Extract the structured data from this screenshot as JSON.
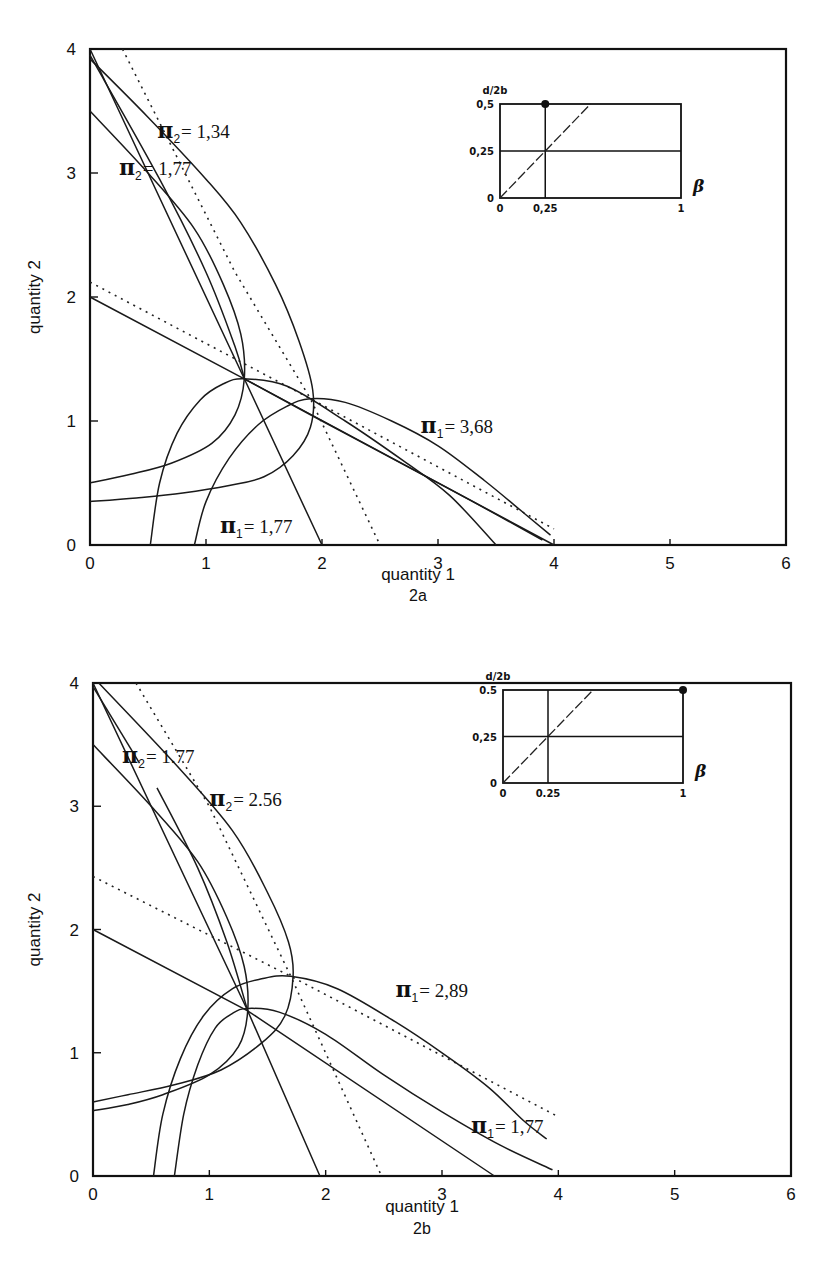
{
  "chart_data": [
    {
      "id": "2a",
      "type": "line",
      "caption": "2a",
      "xlabel": "quantity 1",
      "ylabel": "quantity 2",
      "xlim": [
        0,
        6
      ],
      "ylim": [
        0,
        4
      ],
      "xticks": [
        "0",
        "1",
        "2",
        "3",
        "4",
        "5",
        "6"
      ],
      "yticks": [
        "0",
        "1",
        "2",
        "3",
        "4"
      ],
      "grid": false,
      "annotations": [
        {
          "text_prefix": "π",
          "sub": "2",
          "text": "= 1,34",
          "x": 0.58,
          "y": 3.28
        },
        {
          "text_prefix": "π",
          "sub": "2",
          "text": "= 1,77",
          "x": 0.25,
          "y": 2.98
        },
        {
          "text_prefix": "π",
          "sub": "1",
          "text": "= 3,68",
          "x": 2.85,
          "y": 0.9
        },
        {
          "text_prefix": "π",
          "sub": "1",
          "text": "= 1,77",
          "x": 1.12,
          "y": 0.1
        }
      ],
      "series": [
        {
          "name": "reaction line firm 2 (solid, from q2=4)",
          "style": "solid",
          "points": [
            [
              0,
              4.0
            ],
            [
              1.33,
              1.34
            ],
            [
              2.0,
              0.0
            ]
          ]
        },
        {
          "name": "reaction line firm 1 (solid, from q2=2)",
          "style": "solid",
          "points": [
            [
              0,
              2.0
            ],
            [
              1.33,
              1.34
            ],
            [
              4.0,
              0.0
            ]
          ]
        },
        {
          "name": "reaction line firm 2 dotted (Stackelberg)",
          "style": "dotted",
          "points": [
            [
              0.28,
              4.0
            ],
            [
              1.25,
              2.2
            ],
            [
              1.9,
              1.18
            ],
            [
              2.5,
              0.0
            ]
          ]
        },
        {
          "name": "reaction line firm 1 dotted",
          "style": "dotted",
          "points": [
            [
              0,
              2.12
            ],
            [
              1.9,
              1.18
            ],
            [
              4.0,
              0.13
            ]
          ]
        },
        {
          "name": "π2 = 1,34 iso-profit",
          "style": "solid",
          "points": [
            [
              0,
              3.92
            ],
            [
              0.5,
              3.45
            ],
            [
              1.0,
              2.95
            ],
            [
              1.3,
              2.6
            ],
            [
              1.6,
              2.1
            ],
            [
              1.8,
              1.65
            ],
            [
              1.92,
              1.25
            ],
            [
              1.9,
              0.95
            ],
            [
              1.75,
              0.72
            ],
            [
              1.5,
              0.55
            ],
            [
              1.2,
              0.48
            ],
            [
              0.8,
              0.42
            ],
            [
              0.4,
              0.38
            ],
            [
              0,
              0.35
            ]
          ]
        },
        {
          "name": "π2 = 1,77 iso-profit",
          "style": "solid",
          "points": [
            [
              0,
              3.5
            ],
            [
              0.5,
              3.0
            ],
            [
              0.9,
              2.55
            ],
            [
              1.15,
              2.1
            ],
            [
              1.3,
              1.7
            ],
            [
              1.33,
              1.34
            ],
            [
              1.25,
              1.05
            ],
            [
              1.05,
              0.82
            ],
            [
              0.7,
              0.66
            ],
            [
              0.35,
              0.57
            ],
            [
              0,
              0.5
            ]
          ]
        },
        {
          "name": "π2 upper line from 4 (tangent)",
          "style": "solid",
          "points": [
            [
              0,
              3.95
            ],
            [
              0.6,
              2.95
            ],
            [
              1.0,
              2.2
            ],
            [
              1.25,
              1.6
            ],
            [
              1.33,
              1.34
            ]
          ]
        },
        {
          "name": "π1 = 1,77 iso-profit",
          "style": "solid",
          "points": [
            [
              0.52,
              0.0
            ],
            [
              0.6,
              0.5
            ],
            [
              0.75,
              0.9
            ],
            [
              0.95,
              1.17
            ],
            [
              1.15,
              1.3
            ],
            [
              1.33,
              1.34
            ],
            [
              1.7,
              1.28
            ],
            [
              2.2,
              1.0
            ],
            [
              2.7,
              0.68
            ],
            [
              3.1,
              0.4
            ],
            [
              3.5,
              0.0
            ]
          ]
        },
        {
          "name": "π1 = 3,68 iso-profit",
          "style": "solid",
          "points": [
            [
              0.9,
              0.0
            ],
            [
              1.0,
              0.35
            ],
            [
              1.2,
              0.7
            ],
            [
              1.45,
              0.97
            ],
            [
              1.7,
              1.12
            ],
            [
              1.9,
              1.18
            ],
            [
              2.2,
              1.15
            ],
            [
              2.6,
              1.0
            ],
            [
              3.0,
              0.8
            ],
            [
              3.4,
              0.52
            ],
            [
              3.75,
              0.25
            ],
            [
              3.97,
              0.08
            ]
          ]
        },
        {
          "name": "firm 1 line to (3.9,0)",
          "style": "solid",
          "points": [
            [
              1.33,
              1.34
            ],
            [
              2.0,
              1.0
            ],
            [
              2.7,
              0.65
            ],
            [
              3.3,
              0.35
            ],
            [
              3.9,
              0.04
            ]
          ]
        }
      ],
      "inset": {
        "ylabel": "d/2b",
        "xlabel": "β",
        "yticks": [
          "0",
          "0,25",
          "0,5"
        ],
        "xticks": [
          "0",
          "0,25",
          "1"
        ],
        "marker": {
          "beta": 0.25,
          "d2b": 0.5
        }
      }
    },
    {
      "id": "2b",
      "type": "line",
      "caption": "2b",
      "xlabel": "quantity 1",
      "ylabel": "quantity 2",
      "xlim": [
        0,
        6
      ],
      "ylim": [
        0,
        4
      ],
      "xticks": [
        "0",
        "1",
        "2",
        "3",
        "4",
        "5",
        "6"
      ],
      "yticks": [
        "0",
        "1",
        "2",
        "3",
        "4"
      ],
      "grid": false,
      "annotations": [
        {
          "text_prefix": "π",
          "sub": "2",
          "text": "= 1.77",
          "x": 0.25,
          "y": 3.35
        },
        {
          "text_prefix": "π",
          "sub": "2",
          "text": "= 2.56",
          "x": 1.0,
          "y": 3.0
        },
        {
          "text_prefix": "π",
          "sub": "1",
          "text": "= 2,89",
          "x": 2.6,
          "y": 1.45
        },
        {
          "text_prefix": "π",
          "sub": "1",
          "text": "= 1,77",
          "x": 3.25,
          "y": 0.35
        }
      ],
      "series": [
        {
          "name": "reaction line firm 2 (solid, from q2=4)",
          "style": "solid",
          "points": [
            [
              0,
              4.0
            ],
            [
              1.33,
              1.34
            ],
            [
              1.95,
              0.0
            ]
          ]
        },
        {
          "name": "reaction line firm 1 (solid, from q2=2)",
          "style": "solid",
          "points": [
            [
              0,
              2.0
            ],
            [
              1.33,
              1.34
            ],
            [
              3.45,
              0.0
            ]
          ]
        },
        {
          "name": "reaction line firm 2 dotted",
          "style": "dotted",
          "points": [
            [
              0.37,
              4.0
            ],
            [
              1.0,
              3.0
            ],
            [
              1.7,
              1.62
            ],
            [
              2.48,
              0.0
            ]
          ]
        },
        {
          "name": "reaction line firm 1 dotted",
          "style": "dotted",
          "points": [
            [
              0,
              2.43
            ],
            [
              1.7,
              1.62
            ],
            [
              4.0,
              0.48
            ]
          ]
        },
        {
          "name": "π2 = 2.56 iso-profit",
          "style": "solid",
          "points": [
            [
              0.05,
              4.0
            ],
            [
              0.7,
              3.35
            ],
            [
              1.2,
              2.8
            ],
            [
              1.5,
              2.3
            ],
            [
              1.68,
              1.9
            ],
            [
              1.72,
              1.62
            ],
            [
              1.65,
              1.3
            ],
            [
              1.45,
              1.08
            ],
            [
              1.1,
              0.86
            ],
            [
              0.7,
              0.74
            ],
            [
              0.3,
              0.66
            ],
            [
              0,
              0.6
            ]
          ]
        },
        {
          "name": "π2 = 1.77 iso-profit",
          "style": "solid",
          "points": [
            [
              0,
              3.5
            ],
            [
              0.5,
              3.0
            ],
            [
              0.9,
              2.55
            ],
            [
              1.15,
              2.1
            ],
            [
              1.3,
              1.7
            ],
            [
              1.33,
              1.34
            ],
            [
              1.25,
              1.05
            ],
            [
              1.0,
              0.82
            ],
            [
              0.6,
              0.66
            ],
            [
              0.3,
              0.58
            ],
            [
              0,
              0.53
            ]
          ]
        },
        {
          "name": "π2 upper line (from 4)",
          "style": "solid",
          "points": [
            [
              0,
              3.97
            ],
            [
              0.4,
              3.35
            ]
          ]
        },
        {
          "name": "π2 inner line",
          "style": "solid",
          "points": [
            [
              0.55,
              3.15
            ],
            [
              0.9,
              2.5
            ],
            [
              1.15,
              1.9
            ],
            [
              1.33,
              1.34
            ]
          ]
        },
        {
          "name": "π1 = 1,77 iso-profit",
          "style": "solid",
          "points": [
            [
              0.7,
              0.0
            ],
            [
              0.78,
              0.5
            ],
            [
              0.9,
              0.9
            ],
            [
              1.05,
              1.2
            ],
            [
              1.2,
              1.32
            ],
            [
              1.33,
              1.36
            ],
            [
              1.6,
              1.33
            ],
            [
              2.0,
              1.15
            ],
            [
              2.5,
              0.82
            ],
            [
              3.0,
              0.52
            ],
            [
              3.5,
              0.25
            ],
            [
              3.95,
              0.05
            ]
          ]
        },
        {
          "name": "π1 = 2,89 iso-profit",
          "style": "solid",
          "points": [
            [
              0.52,
              0.0
            ],
            [
              0.6,
              0.5
            ],
            [
              0.75,
              0.95
            ],
            [
              0.95,
              1.3
            ],
            [
              1.2,
              1.52
            ],
            [
              1.45,
              1.6
            ],
            [
              1.7,
              1.62
            ],
            [
              2.1,
              1.52
            ],
            [
              2.6,
              1.25
            ],
            [
              3.0,
              1.0
            ],
            [
              3.4,
              0.72
            ],
            [
              3.7,
              0.45
            ],
            [
              3.9,
              0.3
            ]
          ]
        }
      ],
      "inset": {
        "ylabel": "d/2b",
        "xlabel": "β",
        "yticks": [
          "0",
          "0,25",
          "0.5"
        ],
        "xticks": [
          "0",
          "0.25",
          "1"
        ],
        "marker": {
          "beta": 1.0,
          "d2b": 0.5
        }
      }
    }
  ],
  "figure": {
    "panels": [
      {
        "caption": "2a",
        "xlabel": "quantity 1",
        "ylabel": "quantity 2"
      },
      {
        "caption": "2b",
        "xlabel": "quantity 1",
        "ylabel": "quantity 2"
      }
    ]
  }
}
